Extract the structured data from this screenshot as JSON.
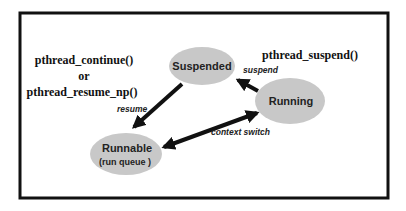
{
  "diagram": {
    "type": "state-diagram",
    "nodes": {
      "suspended": {
        "label": "Suspended"
      },
      "running": {
        "label": "Running"
      },
      "runnable": {
        "label": "Runnable",
        "sublabel": "(run queue )"
      }
    },
    "edges": {
      "suspend": {
        "from": "running",
        "to": "suspended",
        "label": "suspend"
      },
      "resume": {
        "from": "suspended",
        "to": "runnable",
        "label": "resume"
      },
      "context_switch": {
        "from": "running",
        "to": "runnable",
        "label": "context switch",
        "bidirectional": true
      }
    },
    "annotations": {
      "resume_api_line1": "pthread_continue()",
      "resume_api_or": "or",
      "resume_api_line2": "pthread_resume_np()",
      "suspend_api": "pthread_suspend()"
    },
    "colors": {
      "node_fill": "#c8c8c8",
      "stroke": "#111111"
    }
  }
}
